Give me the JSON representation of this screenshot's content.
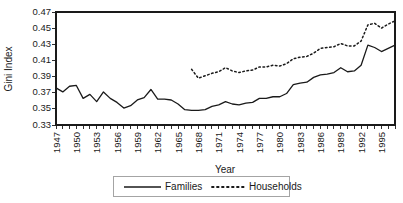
{
  "chart_data": {
    "type": "line",
    "title": "",
    "xlabel": "Year",
    "ylabel": "Gini Index",
    "ylim": [
      0.33,
      0.47
    ],
    "ytick_values": [
      0.33,
      0.35,
      0.37,
      0.39,
      0.41,
      0.43,
      0.45,
      0.47
    ],
    "ytick_labels": [
      "0.33",
      "0.35",
      "0.37",
      "0.39",
      "0.41",
      "0.43",
      "0.45",
      "0.47"
    ],
    "xlim": [
      1947,
      1997
    ],
    "xtick_labels": [
      "1947",
      "1950",
      "1953",
      "1956",
      "1959",
      "1962",
      "1965",
      "1968",
      "1971",
      "1974",
      "1977",
      "1980",
      "1983",
      "1986",
      "1989",
      "1992",
      "1995"
    ],
    "xtick_values": [
      1947,
      1950,
      1953,
      1956,
      1959,
      1962,
      1965,
      1968,
      1971,
      1974,
      1977,
      1980,
      1983,
      1986,
      1989,
      1992,
      1995
    ],
    "xtick_label_rotation": -90,
    "grid": false,
    "legend_position": "bottom",
    "series": [
      {
        "name": "Families",
        "style": "solid",
        "color": "#1a1a1a",
        "x": [
          1947,
          1948,
          1949,
          1950,
          1951,
          1952,
          1953,
          1954,
          1955,
          1956,
          1957,
          1958,
          1959,
          1960,
          1961,
          1962,
          1963,
          1964,
          1965,
          1966,
          1967,
          1968,
          1969,
          1970,
          1971,
          1972,
          1973,
          1974,
          1975,
          1976,
          1977,
          1978,
          1979,
          1980,
          1981,
          1982,
          1983,
          1984,
          1985,
          1986,
          1987,
          1988,
          1989,
          1990,
          1991,
          1992,
          1993,
          1994,
          1995,
          1996,
          1997
        ],
        "values": [
          0.376,
          0.371,
          0.378,
          0.379,
          0.363,
          0.368,
          0.359,
          0.371,
          0.363,
          0.358,
          0.351,
          0.354,
          0.361,
          0.364,
          0.374,
          0.362,
          0.362,
          0.361,
          0.356,
          0.349,
          0.348,
          0.348,
          0.349,
          0.353,
          0.355,
          0.359,
          0.356,
          0.355,
          0.357,
          0.358,
          0.363,
          0.363,
          0.365,
          0.365,
          0.369,
          0.38,
          0.382,
          0.383,
          0.389,
          0.392,
          0.393,
          0.395,
          0.401,
          0.396,
          0.397,
          0.404,
          0.429,
          0.426,
          0.421,
          0.425,
          0.429
        ],
        "last_value": 0.429
      },
      {
        "name": "Households",
        "style": "dotted",
        "color": "#1a1a1a",
        "x": [
          1967,
          1968,
          1969,
          1970,
          1971,
          1972,
          1973,
          1974,
          1975,
          1976,
          1977,
          1978,
          1979,
          1980,
          1981,
          1982,
          1983,
          1984,
          1985,
          1986,
          1987,
          1988,
          1989,
          1990,
          1991,
          1992,
          1993,
          1994,
          1995,
          1996,
          1997
        ],
        "values": [
          0.399,
          0.388,
          0.391,
          0.394,
          0.396,
          0.401,
          0.397,
          0.395,
          0.397,
          0.398,
          0.402,
          0.402,
          0.404,
          0.403,
          0.406,
          0.412,
          0.414,
          0.415,
          0.419,
          0.425,
          0.426,
          0.427,
          0.431,
          0.428,
          0.428,
          0.434,
          0.454,
          0.456,
          0.45,
          0.455,
          0.459
        ],
        "last_value": 0.459
      }
    ]
  },
  "legend": {
    "items": [
      {
        "label": "Families",
        "style": "solid"
      },
      {
        "label": "Households",
        "style": "dotted"
      }
    ]
  }
}
